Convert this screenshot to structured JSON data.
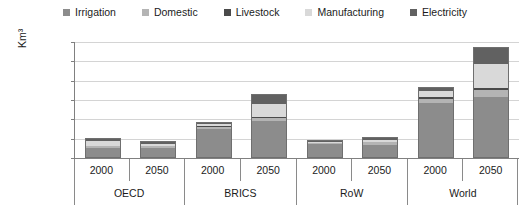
{
  "chart_data": {
    "type": "bar",
    "stacked": true,
    "title": "",
    "xlabel": "",
    "ylabel": "Km³",
    "ylim": [
      0,
      6000
    ],
    "yticks": [
      "0",
      "1 000",
      "2 000",
      "3 000",
      "4 000",
      "5 000",
      "6 000"
    ],
    "ytick_values": [
      0,
      1000,
      2000,
      3000,
      4000,
      5000,
      6000
    ],
    "grid": true,
    "legend_position": "top-center",
    "groups": [
      "OECD",
      "BRICS",
      "RoW",
      "World"
    ],
    "years": [
      "2000",
      "2050"
    ],
    "categories": [
      "OECD 2000",
      "OECD 2050",
      "BRICS 2000",
      "BRICS 2050",
      "RoW 2000",
      "RoW 2050",
      "World 2000",
      "World 2050"
    ],
    "series": [
      {
        "name": "Irrigation",
        "color": "#8c8c8c",
        "values": [
          530,
          530,
          1560,
          1920,
          760,
          700,
          2860,
          3140
        ]
      },
      {
        "name": "Domestic",
        "color": "#b4b4b4",
        "values": [
          90,
          100,
          90,
          170,
          60,
          130,
          240,
          400
        ]
      },
      {
        "name": "Livestock",
        "color": "#4a4a4a",
        "values": [
          30,
          30,
          30,
          40,
          20,
          30,
          80,
          100
        ]
      },
      {
        "name": "Manufacturing",
        "color": "#d9d9d9",
        "values": [
          260,
          100,
          110,
          700,
          60,
          140,
          320,
          1260
        ]
      },
      {
        "name": "Electricity",
        "color": "#616161",
        "values": [
          130,
          110,
          80,
          470,
          30,
          90,
          170,
          850
        ]
      }
    ],
    "totals": [
      1040,
      870,
      1870,
      3300,
      930,
      1090,
      3670,
      5750
    ]
  },
  "legend": {
    "items": [
      {
        "label": "Irrigation",
        "color": "#8c8c8c"
      },
      {
        "label": "Domestic",
        "color": "#b4b4b4"
      },
      {
        "label": "Livestock",
        "color": "#4a4a4a"
      },
      {
        "label": "Manufacturing",
        "color": "#d9d9d9"
      },
      {
        "label": "Electricity",
        "color": "#616161"
      }
    ]
  },
  "axes": {
    "y_title": "Km³"
  }
}
